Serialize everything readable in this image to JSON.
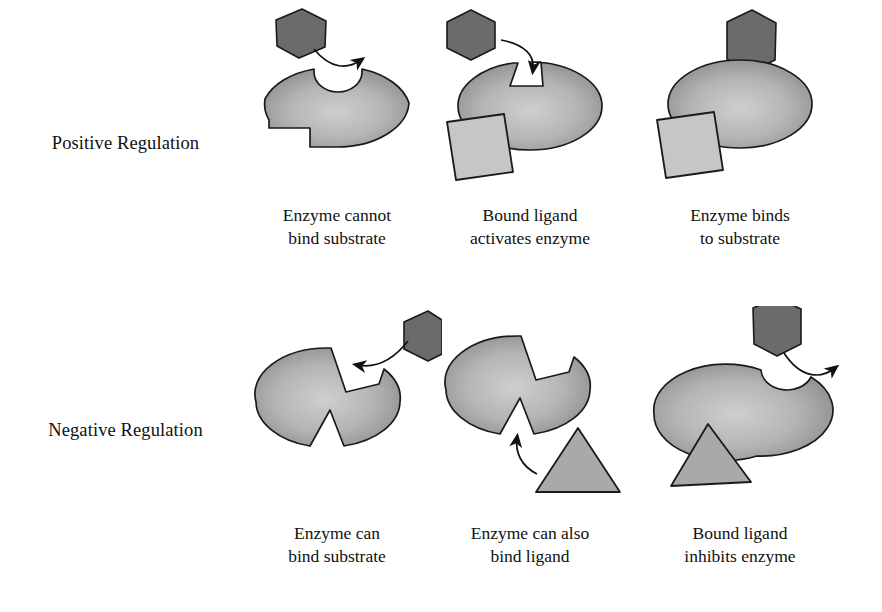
{
  "figure": {
    "background": "#ffffff",
    "colors": {
      "substrate": "#6b6b6b",
      "enzyme_light": "#c0c0c0",
      "enzyme_dark": "#8c8c8c",
      "ligand_square": "#c6c6c6",
      "ligand_triangle": "#a9a9a9",
      "outline": "#1a1a1a",
      "arrow": "#111111",
      "text": "#111111"
    }
  },
  "rows": [
    {
      "id": "positive-regulation",
      "label": "Positive Regulation",
      "panels": [
        {
          "id": "pos-1",
          "caption_line1": "Enzyme cannot",
          "caption_line2": "bind substrate",
          "shapes": [
            "enzyme",
            "substrate-hexagon",
            "curved-arrow"
          ],
          "substrate_bound": "false",
          "ligand_bound": "false",
          "substrate_site": "round-notch-incompatible",
          "ligand_site": "rectangular-notch-empty"
        },
        {
          "id": "pos-2",
          "caption_line1": "Bound ligand",
          "caption_line2": "activates enzyme",
          "shapes": [
            "enzyme",
            "substrate-hexagon",
            "curved-arrow",
            "ligand-square"
          ],
          "substrate_bound": "false",
          "ligand_bound": "true",
          "substrate_site": "angular-notch-compatible",
          "ligand_site": "rectangular-notch-filled"
        },
        {
          "id": "pos-3",
          "caption_line1": "Enzyme binds",
          "caption_line2": "to substrate",
          "shapes": [
            "enzyme",
            "substrate-hexagon",
            "ligand-square"
          ],
          "substrate_bound": "true",
          "ligand_bound": "true",
          "substrate_site": "occupied",
          "ligand_site": "occupied"
        }
      ]
    },
    {
      "id": "negative-regulation",
      "label": "Negative Regulation",
      "panels": [
        {
          "id": "neg-1",
          "caption_line1": "Enzyme can",
          "caption_line2": "bind substrate",
          "shapes": [
            "enzyme",
            "substrate-hexagon",
            "curved-arrow"
          ],
          "substrate_bound": "false",
          "ligand_bound": "false",
          "substrate_site": "angular-notch-compatible",
          "ligand_site": "triangular-notch-empty"
        },
        {
          "id": "neg-2",
          "caption_line1": "Enzyme can also",
          "caption_line2": "bind ligand",
          "shapes": [
            "enzyme",
            "ligand-triangle",
            "curved-arrow"
          ],
          "substrate_bound": "false",
          "ligand_bound": "false",
          "substrate_site": "angular-notch-compatible",
          "ligand_site": "triangular-notch-empty"
        },
        {
          "id": "neg-3",
          "caption_line1": "Bound ligand",
          "caption_line2": "inhibits enzyme",
          "shapes": [
            "enzyme",
            "substrate-hexagon",
            "curved-arrow",
            "ligand-triangle"
          ],
          "substrate_bound": "false",
          "ligand_bound": "true",
          "substrate_site": "round-notch-incompatible",
          "ligand_site": "occupied"
        }
      ]
    }
  ]
}
